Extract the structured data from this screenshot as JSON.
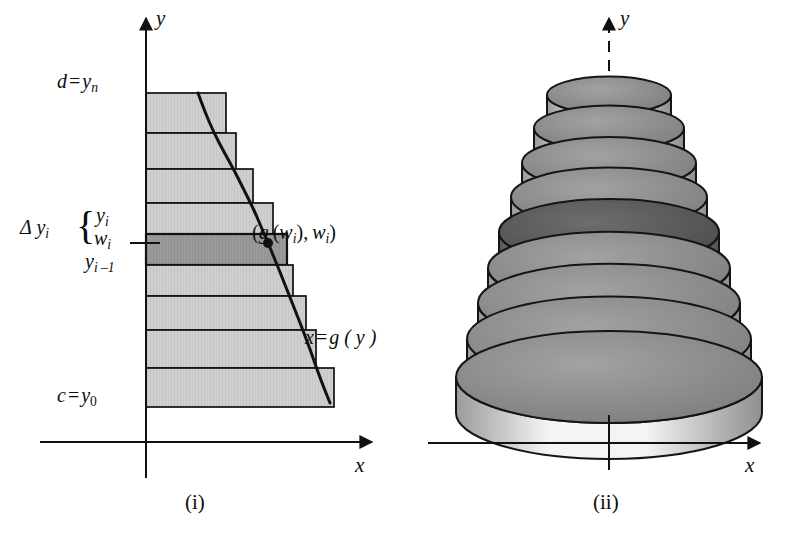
{
  "figure": {
    "background_color": "#ffffff",
    "ink_color": "#111111"
  },
  "panel_i": {
    "caption": "(i)",
    "axes": {
      "y_label": "y",
      "x_label": "x",
      "origin_x_px": 146,
      "origin_y_px": 442
    },
    "labels": {
      "top_bound": {
        "lhs": "d",
        "eq": "=",
        "base": "y",
        "sub": "n"
      },
      "bottom_bound": {
        "lhs": "c",
        "eq": "=",
        "base": "y",
        "sub": "0"
      },
      "delta": {
        "base": "Δ y",
        "sub": "i"
      },
      "brace": "{",
      "y_i": {
        "base": "y",
        "sub": "i"
      },
      "w_i": {
        "base": "w",
        "sub": "i"
      },
      "y_i_minus_1": {
        "base": "y",
        "sub": "i –1"
      },
      "sample_point": "( g (w_i), w_i )",
      "curve": {
        "lhs": "x",
        "eq": "=",
        "rhs": "g ( y )"
      }
    },
    "rect_fill_light": "#cfcfcf",
    "rect_fill_highlight": "#9a9a9a",
    "rect_stroke": "#111111",
    "curve_stroke": "#111111",
    "chart_data": {
      "type": "area",
      "title": "Region bounded by x = g(y), y = c, y = d approximated by horizontal rectangles",
      "xlabel": "x",
      "ylabel": "y",
      "curve_label": "x = g(y)",
      "axis_origin": {
        "x": 146,
        "y": 442
      },
      "y_bounds": {
        "c": "y_0",
        "d": "y_n"
      },
      "rectangles": [
        {
          "index": 9,
          "y_top_px": 93,
          "y_bottom_px": 133,
          "x_right_px": 226,
          "shade": "light"
        },
        {
          "index": 8,
          "y_top_px": 133,
          "y_bottom_px": 169,
          "x_right_px": 236,
          "shade": "light"
        },
        {
          "index": 7,
          "y_top_px": 169,
          "y_bottom_px": 203,
          "x_right_px": 253,
          "shade": "light"
        },
        {
          "index": 6,
          "y_top_px": 203,
          "y_bottom_px": 234,
          "x_right_px": 273,
          "shade": "light"
        },
        {
          "index": 5,
          "y_top_px": 234,
          "y_bottom_px": 265,
          "x_right_px": 287,
          "shade": "highlight"
        },
        {
          "index": 4,
          "y_top_px": 265,
          "y_bottom_px": 296,
          "x_right_px": 293,
          "shade": "light"
        },
        {
          "index": 3,
          "y_top_px": 296,
          "y_bottom_px": 330,
          "x_right_px": 306,
          "shade": "light"
        },
        {
          "index": 2,
          "y_top_px": 330,
          "y_bottom_px": 368,
          "x_right_px": 316,
          "shade": "light"
        },
        {
          "index": 1,
          "y_top_px": 368,
          "y_bottom_px": 407,
          "x_right_px": 334,
          "shade": "light"
        }
      ],
      "curve_points_px": [
        [
          198,
          93
        ],
        [
          205,
          112
        ],
        [
          214,
          133
        ],
        [
          224,
          152
        ],
        [
          234,
          170
        ],
        [
          244,
          190
        ],
        [
          254,
          210
        ],
        [
          262,
          229
        ],
        [
          271,
          250
        ],
        [
          280,
          272
        ],
        [
          289,
          295
        ],
        [
          299,
          320
        ],
        [
          310,
          349
        ],
        [
          320,
          378
        ],
        [
          330,
          403
        ]
      ],
      "sample_point_px": [
        268,
        243
      ]
    }
  },
  "panel_ii": {
    "caption": "(ii)",
    "axes": {
      "y_label": "y",
      "x_label": "x",
      "origin_x_px": 609,
      "origin_y_px": 443,
      "y_axis_style_behind_solid": "dashed"
    },
    "disk_top_fill": "#8d8d8d",
    "disk_side_fill": "#ededed",
    "disk_stroke": "#151515",
    "disk_highlight_top_fill": "#5e5e5e",
    "disk_highlight_side_fill": "#8a8a8a",
    "chart_data": {
      "type": "area",
      "title": "Solid of revolution approximated by a stack of circular disks about the y-axis",
      "xlabel": "x",
      "ylabel": "y",
      "axis_origin": {
        "x": 609,
        "y": 443
      },
      "note": "Disk i (5th from top) is shaded darker to match the highlighted rectangle in panel (i).",
      "disks": [
        {
          "index": 9,
          "center_y_px": 95,
          "radius_px": 62,
          "thickness_px": 30,
          "shade": "light"
        },
        {
          "index": 8,
          "center_y_px": 128,
          "radius_px": 75,
          "thickness_px": 30,
          "shade": "light"
        },
        {
          "index": 7,
          "center_y_px": 163,
          "radius_px": 87,
          "thickness_px": 31,
          "shade": "light"
        },
        {
          "index": 6,
          "center_y_px": 197,
          "radius_px": 98,
          "thickness_px": 31,
          "shade": "light"
        },
        {
          "index": 5,
          "center_y_px": 232,
          "radius_px": 110,
          "thickness_px": 33,
          "shade": "highlight"
        },
        {
          "index": 4,
          "center_y_px": 268,
          "radius_px": 121,
          "thickness_px": 33,
          "shade": "light"
        },
        {
          "index": 3,
          "center_y_px": 303,
          "radius_px": 131,
          "thickness_px": 33,
          "shade": "light"
        },
        {
          "index": 2,
          "center_y_px": 339,
          "radius_px": 142,
          "thickness_px": 34,
          "shade": "light"
        },
        {
          "index": 1,
          "center_y_px": 377,
          "radius_px": 153,
          "thickness_px": 36,
          "shade": "light"
        }
      ]
    }
  }
}
